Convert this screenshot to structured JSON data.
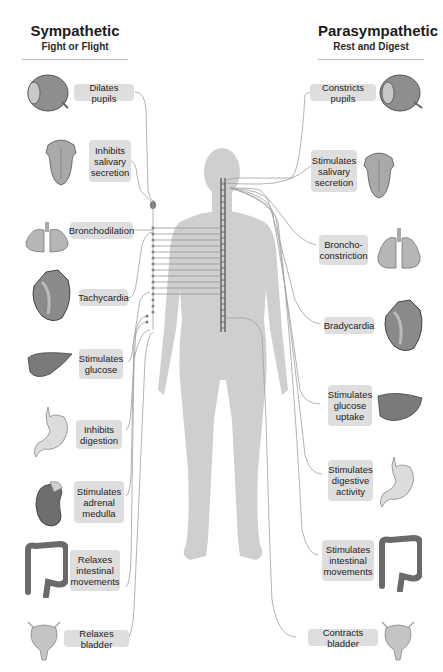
{
  "sympathetic": {
    "title": "Sympathetic",
    "subtitle": "Fight or Flight",
    "effects": [
      {
        "organ": "eye-icon",
        "label": "Dilates pupils"
      },
      {
        "organ": "tongue-icon",
        "label": "Inhibits salivary secretion"
      },
      {
        "organ": "lungs-icon",
        "label": "Bronchodilation"
      },
      {
        "organ": "heart-icon",
        "label": "Tachycardia"
      },
      {
        "organ": "liver-icon",
        "label": "Stimulates glucose"
      },
      {
        "organ": "stomach-icon",
        "label": "Inhibits digestion"
      },
      {
        "organ": "kidney-icon",
        "label": "Stimulates adrenal medulla"
      },
      {
        "organ": "intestine-icon",
        "label": "Relaxes intestinal movements"
      },
      {
        "organ": "bladder-icon",
        "label": "Relaxes bladder"
      }
    ]
  },
  "parasympathetic": {
    "title": "Parasympathetic",
    "subtitle": "Rest and Digest",
    "effects": [
      {
        "organ": "eye-icon",
        "label": "Constricts pupils"
      },
      {
        "organ": "tongue-icon",
        "label": "Stimulates salivary secretion"
      },
      {
        "organ": "lungs-icon",
        "label": "Broncho-constriction"
      },
      {
        "organ": "heart-icon",
        "label": "Bradycardia"
      },
      {
        "organ": "liver-icon",
        "label": "Stimulates glucose uptake"
      },
      {
        "organ": "stomach-icon",
        "label": "Stimulates digestive activity"
      },
      {
        "organ": "intestine-icon",
        "label": "Stimulates intestinal movements"
      },
      {
        "organ": "bladder-icon",
        "label": "Contracts bladder"
      }
    ]
  },
  "colors": {
    "label_bg": "#dedede",
    "body_silhouette": "#cfcfcf",
    "organ_fill": "#a8a8a8",
    "nerve_line": "#9a9a9a",
    "rule": "#bdbdbd"
  }
}
